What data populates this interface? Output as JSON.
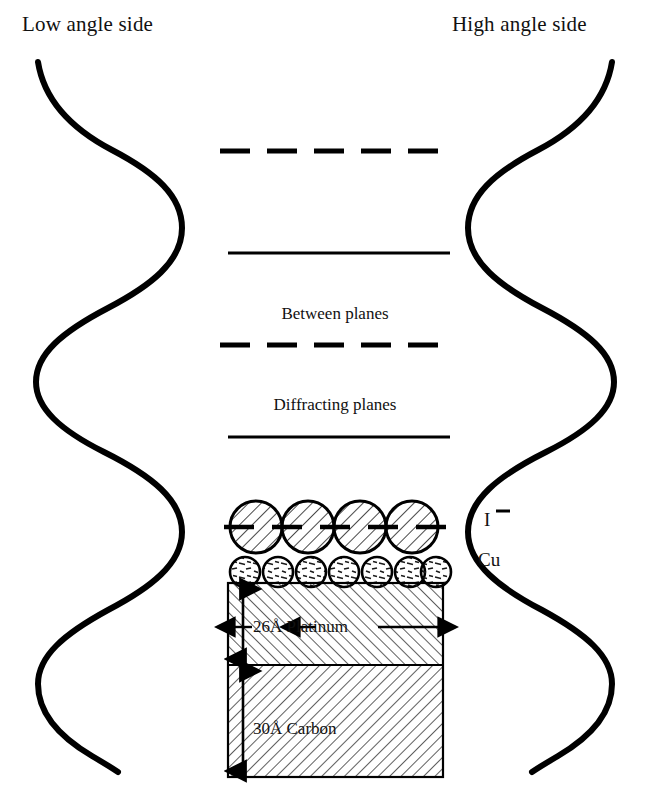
{
  "figure": {
    "title_left": "Low angle side",
    "title_right": "High angle side",
    "background_color": "#ffffff",
    "ink_color": "#000000"
  },
  "headers": {
    "low_angle": "Low angle side",
    "high_angle": "High angle side"
  },
  "plane_lines": [
    {
      "id": "dashed-top",
      "style": "dashed",
      "y": 151,
      "x1": 220,
      "x2": 452,
      "label": ""
    },
    {
      "id": "solid-upper",
      "style": "solid",
      "y": 253,
      "x1": 228,
      "x2": 450,
      "label": ""
    },
    {
      "id": "dashed-middle",
      "style": "dashed",
      "y": 345,
      "x1": 220,
      "x2": 452,
      "label": "Between planes"
    },
    {
      "id": "solid-lower",
      "style": "solid",
      "y": 437,
      "x1": 228,
      "x2": 450,
      "label": "Diffracting planes"
    }
  ],
  "labels": {
    "between_planes": "Between planes",
    "diffracting_planes": "Diffracting planes",
    "iodide": "I",
    "iodide_charge": "−",
    "copper": "Cu"
  },
  "atoms": {
    "large_row": {
      "name": "iodide-circles",
      "count": 4,
      "radius": 26,
      "center_y": 527,
      "centers_x": [
        256,
        308,
        360,
        412
      ],
      "hatch": "diagonal-45",
      "dashed_center_line": {
        "x1": 224,
        "x2": 452,
        "y": 527
      }
    },
    "small_row": {
      "name": "copper-circles",
      "count": 7,
      "radius": 15,
      "center_y": 572,
      "centers_x": [
        245,
        278,
        311,
        344,
        377,
        410,
        436
      ],
      "hatch": "random-dashes"
    }
  },
  "substrate": {
    "x": 228,
    "y": 583,
    "width": 215,
    "height": 194,
    "boundary_y": 665,
    "layers": [
      {
        "name": "platinum",
        "thickness_label": "26Å",
        "material_label": "Platinum",
        "text": "26Å  Platinum",
        "hatch": "diagonal-back",
        "top": 583,
        "bottom": 665,
        "dimension_arrow": {
          "x": 243,
          "y1": 585,
          "y2": 663
        },
        "callout_line": {
          "y": 627,
          "x1": 232,
          "x2": 443
        }
      },
      {
        "name": "carbon",
        "thickness_label": "30Å",
        "material_label": "Carbon",
        "text": "30Å  Carbon",
        "hatch": "diagonal-forward",
        "top": 665,
        "bottom": 777,
        "dimension_arrow": {
          "x": 243,
          "y1": 667,
          "y2": 775
        }
      }
    ]
  },
  "waves": {
    "left": {
      "name": "low-angle-wave",
      "description": "hand-drawn vertical sine wave",
      "x_center": 110,
      "amplitude": 72,
      "y_start": 62,
      "y_end": 772,
      "cycles": 3.25,
      "stroke_width": 6
    },
    "right": {
      "name": "high-angle-wave",
      "description": "hand-drawn vertical sine wave, mirrored",
      "x_center": 540,
      "amplitude": 72,
      "y_start": 62,
      "y_end": 772,
      "cycles": 3.25,
      "stroke_width": 6
    }
  }
}
